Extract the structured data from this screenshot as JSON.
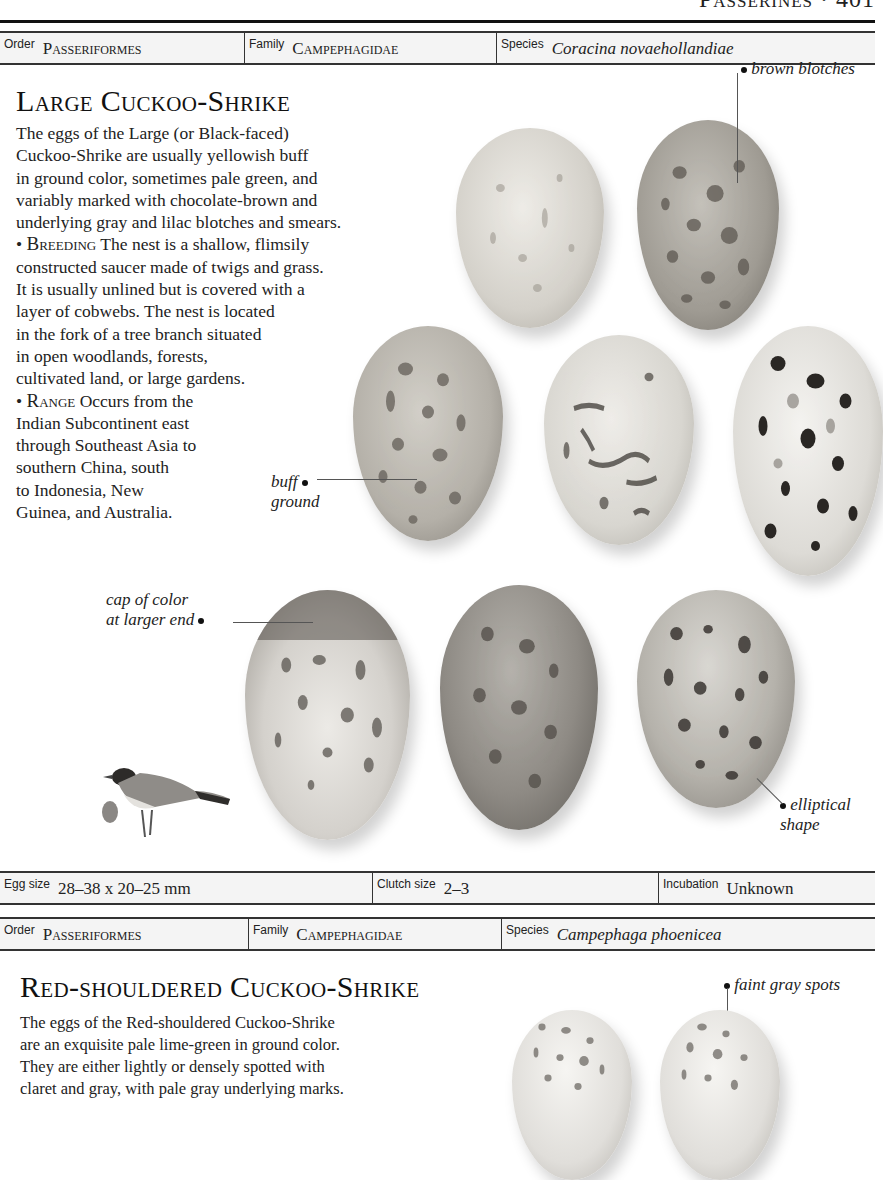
{
  "page": {
    "running_head": "Passerines · 401"
  },
  "species1": {
    "order_label": "Order",
    "order_value": "Passeriformes",
    "family_label": "Family",
    "family_value": "Campephagidae",
    "species_label": "Species",
    "species_value": "Coracina novaehollandiae",
    "title": "Large Cuckoo-Shrike",
    "description_lines": [
      "The eggs of the Large (or Black-faced)",
      "Cuckoo-Shrike are usually yellowish buff",
      "in ground color, sometimes pale green, and",
      "variably marked with chocolate-brown and",
      "underlying gray and lilac blotches and smears."
    ],
    "breeding_heading": "Breeding",
    "breeding_lines": [
      "The nest is a shallow, flimsily",
      "constructed saucer made of twigs and grass.",
      "It is usually unlined but is covered with a",
      "layer of cobwebs. The nest is located",
      "in the fork of a tree branch situated",
      "in open woodlands, forests,",
      "cultivated land, or large gardens."
    ],
    "range_heading": "Range",
    "range_lines": [
      "Occurs from the",
      "Indian Subcontinent east",
      "through Southeast Asia to",
      "southern China, south",
      "to Indonesia, New",
      "Guinea, and Australia."
    ],
    "callouts": {
      "brown_blotches": "brown blotches",
      "buff_ground_1": "buff",
      "buff_ground_2": "ground",
      "cap_of_color_1": "cap of color",
      "cap_of_color_2": "at larger end",
      "elliptical_1": "elliptical",
      "elliptical_2": "shape"
    },
    "egg_size_label": "Egg size",
    "egg_size_value": "28–38 x 20–25 mm",
    "clutch_size_label": "Clutch size",
    "clutch_size_value": "2–3",
    "incubation_label": "Incubation",
    "incubation_value": "Unknown",
    "eggs": [
      {
        "name": "egg-pale-buff",
        "color": "#d9d6cf",
        "spot": "#9a958c"
      },
      {
        "name": "egg-brown-blotched",
        "color": "#a9a59d",
        "spot": "#5f5a53"
      },
      {
        "name": "egg-buff-ground",
        "color": "#b9b6ae",
        "spot": "#6a655e"
      },
      {
        "name": "egg-streaked",
        "color": "#d8d6d0",
        "spot": "#4a4641"
      },
      {
        "name": "egg-dark-spotted",
        "color": "#e0ded9",
        "spot": "#2a2724"
      },
      {
        "name": "egg-capped",
        "color": "#d4d2cd",
        "spot": "#5a5650"
      },
      {
        "name": "egg-dark-ground",
        "color": "#8e8a84",
        "spot": "#55514b"
      },
      {
        "name": "egg-elliptical",
        "color": "#b5b2ab",
        "spot": "#3a3632"
      }
    ]
  },
  "species2": {
    "order_label": "Order",
    "order_value": "Passeriformes",
    "family_label": "Family",
    "family_value": "Campephagidae",
    "species_label": "Species",
    "species_value": "Campephaga phoenicea",
    "title": "Red-shouldered Cuckoo-Shrike",
    "description_lines": [
      "The eggs of the Red-shouldered Cuckoo-Shrike",
      "are an exquisite pale lime-green in ground color.",
      "They are either lightly or densely spotted with",
      "claret and gray, with pale gray underlying marks."
    ],
    "callouts": {
      "faint_gray_spots": "faint gray spots"
    }
  },
  "colors": {
    "ink": "#1a1a1a",
    "bar_bg": "#f4f4f4",
    "rule": "#111111"
  }
}
